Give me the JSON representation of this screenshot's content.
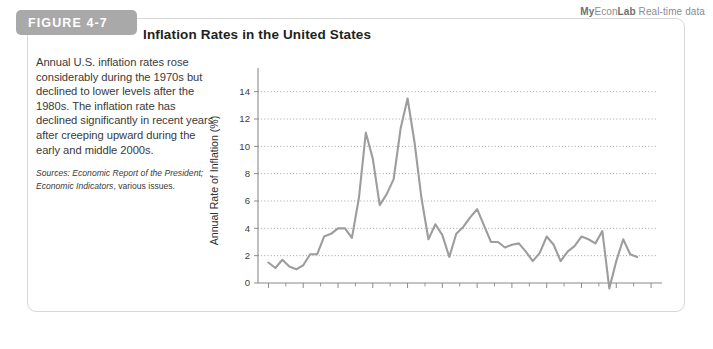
{
  "banner": {
    "part1": "My",
    "part2": "Econ",
    "part3": "Lab",
    "part4": " Real-time data"
  },
  "figure": {
    "tab_label": "FIGURE 4-7",
    "title": "Inflation Rates in the United States",
    "caption": "Annual U.S. inflation rates rose considerably during the 1970s but declined to lower levels after the 1980s. The inflation rate has declined significantly in recent years after creeping upward during the early and middle 2000s.",
    "sources_lead": "Sources:",
    "sources_work1": " Economic Report of the President;",
    "sources_work2": "Economic Indicators",
    "sources_tail": ", various issues."
  },
  "chart_data": {
    "type": "line",
    "title": "Inflation Rates in the United States",
    "xlabel": "Year",
    "ylabel": "Annual Rate of Inflation (%)",
    "xlim": [
      1958.5,
      2016
    ],
    "ylim": [
      0,
      15
    ],
    "grid": true,
    "legend": null,
    "xticks": [
      1960,
      1965,
      1970,
      1975,
      1980,
      1985,
      1990,
      1995,
      2000,
      2005,
      2010,
      2015
    ],
    "yticks": [
      0,
      2,
      4,
      6,
      8,
      10,
      12,
      14
    ],
    "series": [
      {
        "name": "Annual U.S. inflation rate",
        "color": "#9d9d9d",
        "x": [
          1960,
          1961,
          1962,
          1963,
          1964,
          1965,
          1966,
          1967,
          1968,
          1969,
          1970,
          1971,
          1972,
          1973,
          1974,
          1975,
          1976,
          1977,
          1978,
          1979,
          1980,
          1981,
          1982,
          1983,
          1984,
          1985,
          1986,
          1987,
          1988,
          1989,
          1990,
          1991,
          1992,
          1993,
          1994,
          1995,
          1996,
          1997,
          1998,
          1999,
          2000,
          2001,
          2002,
          2003,
          2004,
          2005,
          2006,
          2007,
          2008,
          2009,
          2010,
          2011,
          2012,
          2013
        ],
        "values": [
          1.5,
          1.1,
          1.7,
          1.2,
          1.0,
          1.3,
          2.1,
          2.1,
          3.4,
          3.6,
          4.0,
          4.0,
          3.3,
          6.2,
          11.0,
          9.1,
          5.7,
          6.5,
          7.6,
          11.3,
          13.5,
          10.3,
          6.2,
          3.2,
          4.3,
          3.5,
          1.9,
          3.6,
          4.1,
          4.8,
          5.4,
          4.2,
          3.0,
          3.0,
          2.6,
          2.8,
          2.9,
          2.3,
          1.6,
          2.2,
          3.4,
          2.8,
          1.6,
          2.3,
          2.7,
          3.4,
          3.2,
          2.9,
          3.8,
          -0.4,
          1.6,
          3.2,
          2.1,
          1.9
        ]
      }
    ]
  }
}
